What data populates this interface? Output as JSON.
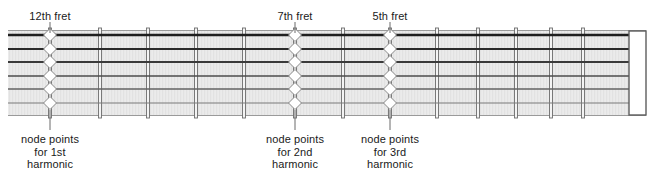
{
  "figure": {
    "name": "guitar-fretboard-harmonic-nodes",
    "width": 654,
    "height": 178,
    "background": "#ffffff"
  },
  "fretboard": {
    "x": 8,
    "y": 30,
    "width": 638,
    "height": 86,
    "fill": "#e8e8e8",
    "edge_color": "#9a9a9a",
    "texture": "vertical-fine-lines"
  },
  "strings": {
    "count": 6,
    "color_dark": "#2a2a2a",
    "color_mid": "#4a4a4a",
    "color_light": "#6e6e6e",
    "y_positions": [
      35,
      49,
      62,
      76,
      89,
      103
    ],
    "thickness": [
      2.4,
      2.2,
      1.9,
      1.6,
      1.3,
      1.1
    ],
    "colors": [
      "#1f1f1f",
      "#2b2b2b",
      "#3a3a3a",
      "#4d4d4d",
      "#636363",
      "#7a7a7a"
    ]
  },
  "frets": {
    "color": "#6d6d6d",
    "fill": "#f4f4f4",
    "width": 3,
    "x_positions": [
      50,
      100,
      148,
      196,
      244,
      295,
      343,
      390,
      437,
      478,
      516,
      551,
      583
    ],
    "node_indices": [
      0,
      5,
      7
    ]
  },
  "nut": {
    "x": 629,
    "width": 17,
    "fill": "#ffffff",
    "edge_color": "#5d5d5d"
  },
  "nodes": {
    "diamond_fill": "#ffffff",
    "diamond_edge": "#8a8a8a",
    "diamond_w": 13,
    "diamond_h": 13,
    "leader_color": "#6b6b6b"
  },
  "labels": {
    "top": [
      {
        "id": "fret-12",
        "text": "12th fret",
        "x": 50,
        "y": 10,
        "anchor_x": 50,
        "leader_from_y": 22,
        "leader_to_y": 33
      },
      {
        "id": "fret-7",
        "text": "7th fret",
        "x": 295,
        "y": 10,
        "anchor_x": 295,
        "leader_from_y": 22,
        "leader_to_y": 33
      },
      {
        "id": "fret-5",
        "text": "5th fret",
        "x": 390,
        "y": 10,
        "anchor_x": 390,
        "leader_from_y": 22,
        "leader_to_y": 33
      }
    ],
    "bottom": [
      {
        "id": "node-1st",
        "lines": [
          "node points",
          "for 1st",
          "harmonic"
        ],
        "x": 50,
        "y": 133,
        "leader_from_y": 110,
        "leader_to_y": 130
      },
      {
        "id": "node-2nd",
        "lines": [
          "node points",
          "for 2nd",
          "harmonic"
        ],
        "x": 295,
        "y": 133,
        "leader_from_y": 110,
        "leader_to_y": 130
      },
      {
        "id": "node-3rd",
        "lines": [
          "node points",
          "for 3rd",
          "harmonic"
        ],
        "x": 390,
        "y": 133,
        "leader_from_y": 110,
        "leader_to_y": 130
      }
    ]
  }
}
